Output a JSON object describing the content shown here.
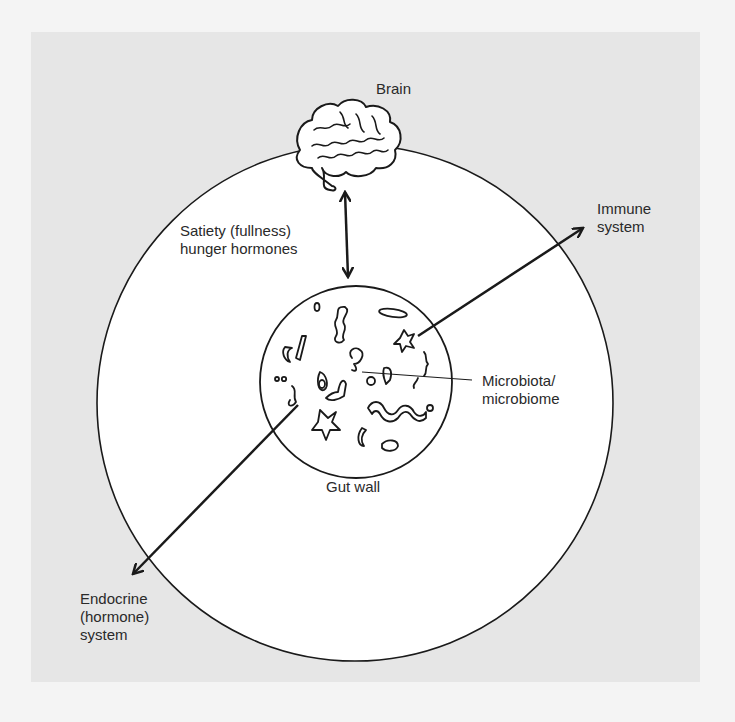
{
  "diagram": {
    "colors": {
      "background": "#f4f4f4",
      "panel": "#e6e6e6",
      "outer_circle_fill": "#ffffff",
      "stroke": "#1a1a1a",
      "text": "#2a2a2a"
    },
    "nodes": {
      "brain": {
        "label": "Brain",
        "icon": "brain-icon"
      },
      "gut_wall": {
        "label": "Gut wall",
        "icon": "microbe-circle-icon"
      },
      "immune": {
        "label": "Immune\nsystem"
      },
      "endocrine": {
        "label": "Endocrine\n(hormone)\nsystem"
      },
      "microbiota": {
        "label": "Microbiota/\nmicrobiome"
      }
    },
    "edges": [
      {
        "from": "brain",
        "to": "gut_wall",
        "type": "double-arrow",
        "label": "Satiety (fullness)\nhunger hormones"
      },
      {
        "from": "gut_wall",
        "to": "immune",
        "type": "arrow"
      },
      {
        "from": "gut_wall",
        "to": "endocrine",
        "type": "arrow"
      },
      {
        "from": "microbiota",
        "to": "gut_wall",
        "type": "leader-line"
      }
    ]
  }
}
